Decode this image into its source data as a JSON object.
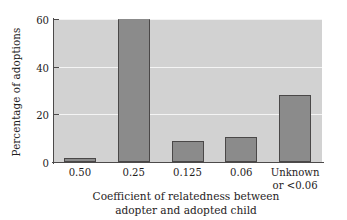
{
  "chart_data": {
    "type": "bar",
    "title": "",
    "xlabel": "Coefficient of relatedness between adopter and adopted child",
    "xlabel_line1": "Coefficient of relatedness between",
    "xlabel_line2": "adopter and adopted child",
    "ylabel": "Percentage of adoptions",
    "categories": [
      "0.50",
      "0.25",
      "0.125",
      "0.06",
      "Unknown or <0.06"
    ],
    "category_labels": [
      {
        "line1": "0.50",
        "line2": ""
      },
      {
        "line1": "0.25",
        "line2": ""
      },
      {
        "line1": "0.125",
        "line2": ""
      },
      {
        "line1": "0.06",
        "line2": ""
      },
      {
        "line1": "Unknown",
        "line2": "or <0.06"
      }
    ],
    "values": [
      1.5,
      60,
      9,
      10.5,
      28
    ],
    "ylim": [
      0,
      60
    ],
    "yticks": [
      0,
      20,
      40,
      60
    ],
    "ytick_labels": [
      "0",
      "20",
      "40",
      "60"
    ],
    "grid": true,
    "gridlines_at": [
      20,
      40,
      60
    ],
    "legend": "none",
    "colors": {
      "bar_fill": "#8b8b8b",
      "bar_edge": "#4a4848",
      "plot_background": "#d2d2d2",
      "gridline": "#f4f4f4",
      "axis": "#4c4a4a",
      "text": "#1f1d1d",
      "figure_background": "#ffffff"
    }
  }
}
